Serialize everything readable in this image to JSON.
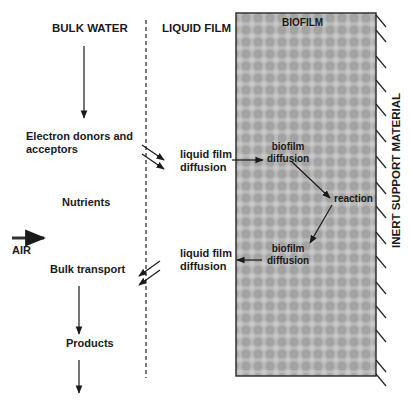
{
  "headers": {
    "bulk_water": "BULK WATER",
    "liquid_film": "LIQUID FILM",
    "biofilm": "BIOFILM",
    "inert_support": "INERT SUPPORT MATERIAL"
  },
  "bulk": {
    "electron_line1": "Electron donors and",
    "electron_line2": "acceptors",
    "nutrients": "Nutrients",
    "air": "AIR",
    "bulk_transport": "Bulk transport",
    "products": "Products"
  },
  "liquid_film": {
    "upper_line1": "liquid film",
    "upper_line2": "diffusion",
    "lower_line1": "liquid film",
    "lower_line2": "diffusion"
  },
  "biofilm": {
    "upper_line1": "biofilm",
    "upper_line2": "diffusion",
    "reaction": "reaction",
    "lower_line1": "biofilm",
    "lower_line2": "diffusion"
  },
  "colors": {
    "biofilm_fill": "#b4b4b4",
    "biofilm_dot": "#9a9a9a",
    "stroke": "#1a1a1a"
  }
}
